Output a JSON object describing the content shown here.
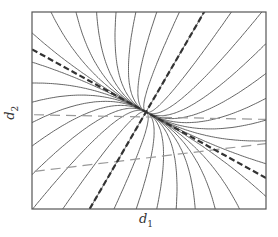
{
  "diagram": {
    "type": "phase-portrait",
    "xlabel": {
      "symbol": "d",
      "subscript": "1"
    },
    "ylabel": {
      "symbol": "d",
      "subscript": "2"
    },
    "colors": {
      "frame": "#555555",
      "trajectory": "#555555",
      "eigen_dashed": "#333333",
      "faint_dashed": "#999999"
    },
    "eigenvectors": {
      "fast_slope": 1.72,
      "slow_slope": -0.55
    },
    "trajectory_count": 34
  }
}
